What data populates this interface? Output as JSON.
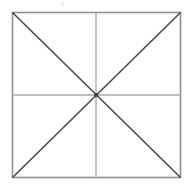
{
  "figure": {
    "title": "",
    "canvas": {
      "width": 193,
      "height": 188,
      "background_color": "#ffffff"
    },
    "square": {
      "name": "outer-square",
      "left": 12.5,
      "top": 12.5,
      "right": 180.5,
      "bottom": 177.5,
      "stroke_color": "#8f8f8f",
      "stroke_width": 1.6,
      "fill": "none"
    },
    "center_point": {
      "name": "center-vertex",
      "x": 96.0,
      "y": 95.0,
      "label": ""
    },
    "midlines": {
      "stroke_color": "#a9a9a9",
      "stroke_width": 1.3,
      "horizontal": {
        "name": "horizontal-midline",
        "x1": 12.5,
        "y1": 95.0,
        "x2": 180.5,
        "y2": 95.0
      },
      "vertical": {
        "name": "vertical-midline",
        "x1": 96.0,
        "y1": 12.5,
        "x2": 96.0,
        "y2": 177.5
      }
    },
    "diagonals": {
      "stroke_color": "#454545",
      "stroke_width": 1.5,
      "main": {
        "name": "diagonal-tl-br",
        "x1": 12.5,
        "y1": 12.5,
        "x2": 180.5,
        "y2": 177.5
      },
      "anti": {
        "name": "diagonal-bl-tr",
        "x1": 12.5,
        "y1": 177.5,
        "x2": 180.5,
        "y2": 12.5
      }
    },
    "artifact": {
      "name": "faint-smudge",
      "visible": true,
      "color": "#f2f2f2"
    }
  }
}
